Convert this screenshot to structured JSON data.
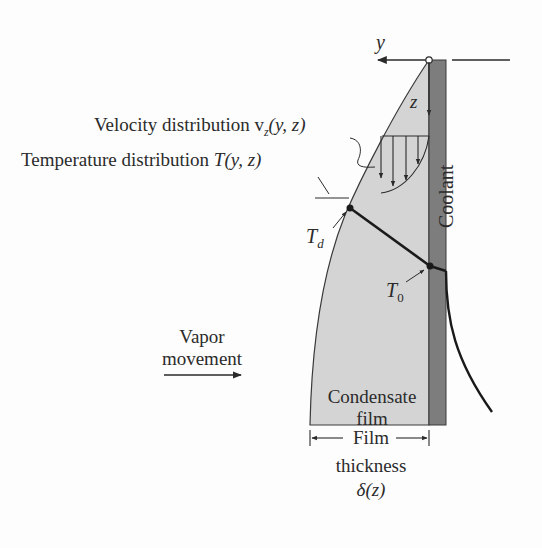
{
  "diagram": {
    "axes": {
      "y_label": "y",
      "z_label": "z"
    },
    "labels": {
      "velocity": "Velocity distribution v",
      "velocity_sub": "z",
      "velocity_args": "(y, z)",
      "temperature": "Temperature distribution ",
      "temperature_sym": "T",
      "temperature_args": "(y, z)",
      "td": "T",
      "td_sub": "d",
      "t0": "T",
      "t0_sub": "0",
      "coolant": "Coolant",
      "vapor_line1": "Vapor",
      "vapor_line2": "movement",
      "condensate_line1": "Condensate",
      "condensate_line2": "film",
      "film_line1": "Film",
      "film_line2": "thickness",
      "film_line3": "δ(z)"
    },
    "colors": {
      "film_fill": "#d4d4d4",
      "wall_fill": "#7d7d7d",
      "line": "#1f1f1f",
      "background": "#fdfdfd"
    }
  }
}
